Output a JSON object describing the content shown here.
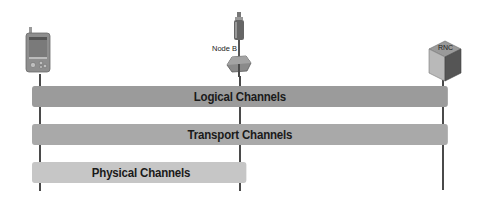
{
  "diagram": {
    "nodes": [
      {
        "id": "ue",
        "label": "",
        "icon": "pda-phone-icon"
      },
      {
        "id": "nodeb",
        "label": "Node B",
        "icon": "antenna-tower-icon"
      },
      {
        "id": "rnc",
        "label": "RNC",
        "icon": "rnc-cube-icon"
      }
    ],
    "channels": [
      {
        "label": "Logical Channels",
        "span": "UE to RNC",
        "color": "#9b9b9b"
      },
      {
        "label": "Transport Channels",
        "span": "UE to RNC",
        "color": "#a9a9a9"
      },
      {
        "label": "Physical Channels",
        "span": "UE to Node B",
        "color": "#c6c6c6"
      }
    ],
    "colors": {
      "line": "#4a4a4a",
      "background": "#ffffff",
      "text": "#1a1a1a"
    }
  }
}
